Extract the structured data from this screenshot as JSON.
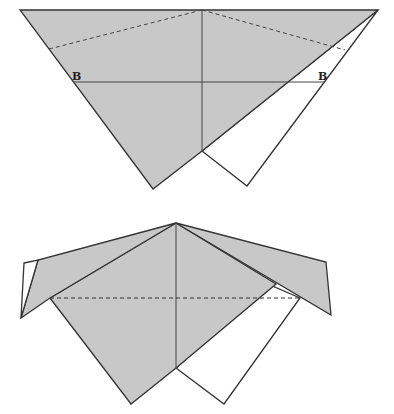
{
  "diagram": {
    "type": "origami-fold-steps",
    "colors": {
      "paper_colored": "#c8c8c8",
      "paper_white": "#ffffff",
      "line": "#333333"
    },
    "steps": [
      {
        "id": "step-1",
        "labels": [
          {
            "text": "B",
            "x": 72,
            "y": 80
          },
          {
            "text": "B",
            "x": 318,
            "y": 80
          }
        ],
        "lines": [
          {
            "kind": "valley-fold",
            "desc": "dashed fold line left"
          },
          {
            "kind": "valley-fold",
            "desc": "dashed fold line right"
          },
          {
            "kind": "crease",
            "desc": "horizontal line B-B"
          },
          {
            "kind": "crease",
            "desc": "vertical center line"
          }
        ]
      },
      {
        "id": "step-2",
        "labels": [],
        "lines": [
          {
            "kind": "valley-fold",
            "desc": "dashed horizontal fold line"
          },
          {
            "kind": "crease",
            "desc": "vertical center line"
          }
        ]
      }
    ]
  }
}
